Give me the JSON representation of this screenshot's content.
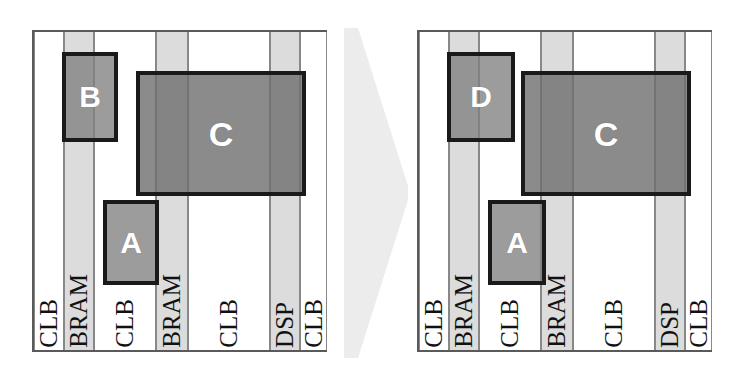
{
  "figure": {
    "panels": [
      {
        "id": "before",
        "name": "left-fpga-fabric",
        "columns": [
          {
            "type": "CLB",
            "label": "CLB",
            "x": 0,
            "width": 30
          },
          {
            "type": "BRAM",
            "label": "BRAM",
            "x": 30,
            "width": 30
          },
          {
            "type": "CLB",
            "label": "CLB",
            "x": 60,
            "width": 62
          },
          {
            "type": "BRAM",
            "label": "BRAM",
            "x": 122,
            "width": 32
          },
          {
            "type": "CLB",
            "label": "CLB",
            "x": 154,
            "width": 82
          },
          {
            "type": "DSP",
            "label": "DSP",
            "x": 236,
            "width": 30
          },
          {
            "type": "CLB",
            "label": "CLB",
            "x": 266,
            "width": 27
          }
        ],
        "modules": [
          {
            "label": "B",
            "x": 28,
            "y": 20,
            "width": 56,
            "height": 90,
            "shade": "mid",
            "font": 30
          },
          {
            "label": "C",
            "x": 102,
            "y": 39,
            "width": 170,
            "height": 125,
            "shade": "dark",
            "font": 34
          },
          {
            "label": "A",
            "x": 69,
            "y": 168,
            "width": 56,
            "height": 85,
            "shade": "mid",
            "font": 30
          }
        ]
      },
      {
        "id": "after",
        "name": "right-fpga-fabric",
        "columns": [
          {
            "type": "CLB",
            "label": "CLB",
            "x": 0,
            "width": 30
          },
          {
            "type": "BRAM",
            "label": "BRAM",
            "x": 30,
            "width": 30
          },
          {
            "type": "CLB",
            "label": "CLB",
            "x": 60,
            "width": 62
          },
          {
            "type": "BRAM",
            "label": "BRAM",
            "x": 122,
            "width": 32
          },
          {
            "type": "CLB",
            "label": "CLB",
            "x": 154,
            "width": 82
          },
          {
            "type": "DSP",
            "label": "DSP",
            "x": 236,
            "width": 30
          },
          {
            "type": "CLB",
            "label": "CLB",
            "x": 266,
            "width": 27
          }
        ],
        "modules": [
          {
            "label": "D",
            "x": 28,
            "y": 20,
            "width": 68,
            "height": 90,
            "shade": "mid",
            "font": 30
          },
          {
            "label": "C",
            "x": 102,
            "y": 39,
            "width": 170,
            "height": 125,
            "shade": "dark",
            "font": 34
          },
          {
            "label": "A",
            "x": 69,
            "y": 168,
            "width": 58,
            "height": 85,
            "shade": "mid",
            "font": 30
          }
        ]
      }
    ],
    "arrow": {
      "name": "transition-arrow",
      "direction": "right",
      "color": "#eceaea"
    },
    "colors": {
      "panel_border": "#5a5a5a",
      "column_border": "#888888",
      "clb_fill": "#ffffff",
      "bram_fill": "#dcdcdc",
      "dsp_fill": "#dcdcdc",
      "module_border": "#1a1a1a",
      "module_mid_fill": "#808080",
      "module_dark_fill": "#6e6e6e",
      "module_label": "#ffffff",
      "column_label": "#111111",
      "background": "#ffffff"
    }
  }
}
